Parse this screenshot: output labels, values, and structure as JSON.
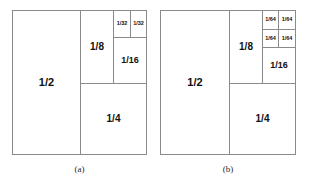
{
  "figure": {
    "kind": "geometric-partition-diagram",
    "line_color": "#8a8a8a",
    "label_color": "#111111",
    "background": "#ffffff",
    "panels": [
      {
        "id": "panel-a",
        "caption": "(a)",
        "cells": [
          {
            "id": "a-half",
            "label": "1/2"
          },
          {
            "id": "a-quarter",
            "label": "1/4"
          },
          {
            "id": "a-eighth",
            "label": "1/8"
          },
          {
            "id": "a-sixteenth",
            "label": "1/16"
          },
          {
            "id": "a-thirtysecond-left",
            "label": "1/32"
          },
          {
            "id": "a-thirtysecond-right",
            "label": "1/32"
          }
        ]
      },
      {
        "id": "panel-b",
        "caption": "(b)",
        "cells": [
          {
            "id": "b-half",
            "label": "1/2"
          },
          {
            "id": "b-quarter",
            "label": "1/4"
          },
          {
            "id": "b-eighth",
            "label": "1/8"
          },
          {
            "id": "b-sixteenth",
            "label": "1/16"
          },
          {
            "id": "b-sixtyfourth-tl",
            "label": "1/64"
          },
          {
            "id": "b-sixtyfourth-tr",
            "label": "1/64"
          },
          {
            "id": "b-sixtyfourth-bl",
            "label": "1/64"
          },
          {
            "id": "b-sixtyfourth-br",
            "label": "1/64"
          }
        ]
      }
    ]
  }
}
